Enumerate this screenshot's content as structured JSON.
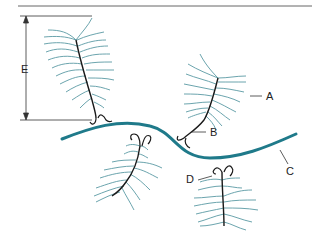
{
  "figure": {
    "type": "diagram",
    "colors": {
      "barb": "#5a9aa4",
      "shaft": "#1a1a1a",
      "strand": "#1f7a8a",
      "rule": "#555555"
    },
    "labels": {
      "A": "A",
      "B": "B",
      "C": "C",
      "D": "D",
      "E": "E"
    }
  }
}
